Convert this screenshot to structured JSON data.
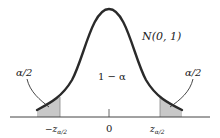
{
  "diagram": {
    "distribution_label": "N(0, 1)",
    "center_label": "1 − α",
    "left_tail_label": "α/2",
    "right_tail_label": "α/2",
    "axis_ticks": {
      "left": "−z",
      "left_sub": "α/2",
      "center": "0",
      "right": "z",
      "right_sub": "α/2"
    },
    "colors": {
      "curve": "#2a2a2a",
      "tail_fill": "#c8c8c8",
      "axis": "#444444",
      "text": "#222222"
    }
  }
}
